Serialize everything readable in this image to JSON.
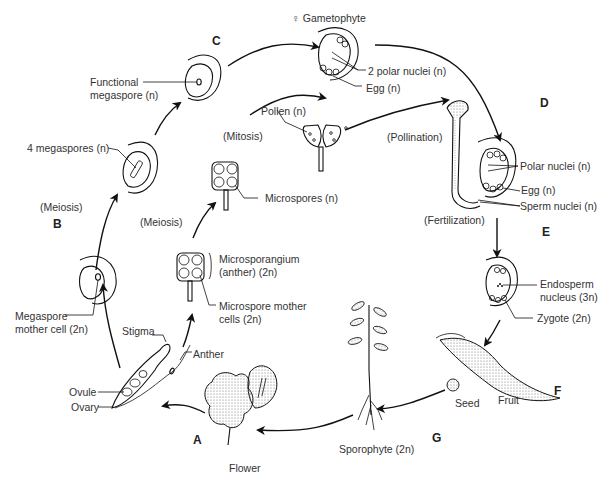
{
  "stages": {
    "A": "A",
    "B": "B",
    "C": "C",
    "D": "D",
    "E": "E",
    "F": "F",
    "G": "G"
  },
  "processes": {
    "meiosis_left": "(Meiosis)",
    "meiosis_middle": "(Meiosis)",
    "mitosis": "(Mitosis)",
    "pollination": "(Pollination)",
    "fertilization": "(Fertilization)"
  },
  "labels": {
    "female_gametophyte": "♀ Gametophyte",
    "two_polar_nuclei": "2 polar nuclei (n)",
    "egg_top": "Egg (n)",
    "functional_megaspore": "Functional\nmegaspore (n)",
    "four_megaspores": "4 megaspores (n)",
    "pollen": "Pollen (n)",
    "microspores": "Microspores (n)",
    "microsporangium": "Microsporangium\n(anther) (2n)",
    "microspore_mother_cells": "Microspore mother\ncells (2n)",
    "megaspore_mother_cell": "Megaspore\nmother cell (2n)",
    "stigma": "Stigma",
    "anther": "Anther",
    "ovule": "Ovule",
    "ovary": "Ovary",
    "flower": "Flower",
    "polar_nuclei": "Polar nuclei (n)",
    "egg_right": "Egg (n)",
    "sperm_nuclei": "Sperm nuclei (n)",
    "endosperm_nucleus": "Endosperm\nnucleus (3n)",
    "zygote": "Zygote (2n)",
    "seed": "Seed",
    "fruit": "Fruit",
    "sporophyte": "Sporophyte (2n)"
  }
}
